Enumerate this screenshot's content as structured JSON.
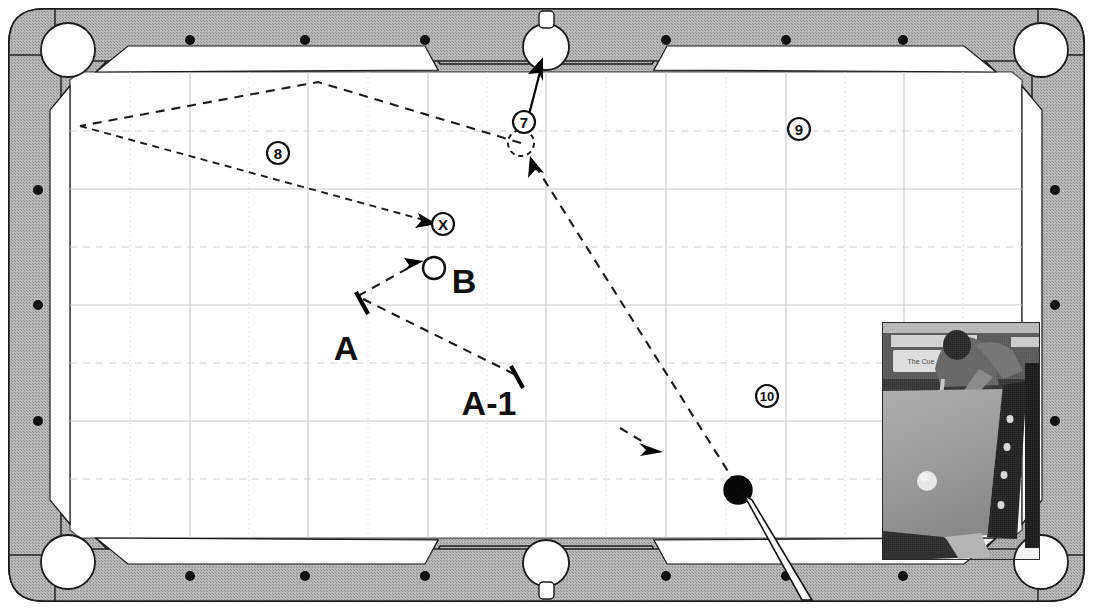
{
  "diagram": {
    "type": "billiards-shot-diagram",
    "canvas": {
      "width": 1093,
      "height": 610
    }
  },
  "colors": {
    "rail": "#b4b4b4",
    "cloth": "#ffffff",
    "ink": "#111111",
    "grid_major": "#c9c9c9",
    "grid_minor": "#d8d8d8"
  },
  "table": {
    "rail_outer": {
      "x": 8,
      "y": 8,
      "width": 1077,
      "height": 594
    },
    "cloth_area": {
      "left": 70,
      "top": 72,
      "right": 1022,
      "bottom": 538
    },
    "pockets": [
      {
        "name": "top-left-pocket",
        "cx": 68,
        "cy": 50,
        "r": 27
      },
      {
        "name": "top-side-pocket",
        "cx": 546,
        "cy": 47,
        "r": 23
      },
      {
        "name": "top-right-pocket",
        "cx": 1041,
        "cy": 50,
        "r": 27
      },
      {
        "name": "bottom-left-pocket",
        "cx": 68,
        "cy": 562,
        "r": 27
      },
      {
        "name": "bottom-side-pocket",
        "cx": 546,
        "cy": 563,
        "r": 23
      },
      {
        "name": "bottom-right-pocket",
        "cx": 1041,
        "cy": 562,
        "r": 27
      }
    ],
    "diamonds": {
      "top": [
        {
          "x": 190,
          "y": 40
        },
        {
          "x": 305,
          "y": 40
        },
        {
          "x": 425,
          "y": 40
        },
        {
          "x": 666,
          "y": 40
        },
        {
          "x": 786,
          "y": 40
        },
        {
          "x": 903,
          "y": 40
        }
      ],
      "bottom": [
        {
          "x": 190,
          "y": 576
        },
        {
          "x": 305,
          "y": 576
        },
        {
          "x": 425,
          "y": 576
        },
        {
          "x": 666,
          "y": 576
        },
        {
          "x": 786,
          "y": 576
        },
        {
          "x": 903,
          "y": 576
        }
      ],
      "left": [
        {
          "x": 38,
          "y": 190
        },
        {
          "x": 38,
          "y": 305
        },
        {
          "x": 38,
          "y": 421
        }
      ],
      "right": [
        {
          "x": 1055,
          "y": 190
        },
        {
          "x": 1055,
          "y": 305
        },
        {
          "x": 1055,
          "y": 421
        }
      ]
    }
  },
  "grid": {
    "major_vertical_x": [
      190,
      308,
      428,
      546,
      666,
      786,
      904
    ],
    "major_horizontal_y": [
      189,
      305,
      421
    ],
    "minor_vertical_x": [
      130,
      249,
      368,
      487,
      606,
      726,
      845,
      963
    ],
    "minor_horizontal_y": [
      131,
      247,
      363,
      479
    ]
  },
  "balls": [
    {
      "name": "ball-8",
      "label": "8",
      "cx": 278,
      "cy": 153,
      "r": 11,
      "style": "numbered-marker"
    },
    {
      "name": "ball-9",
      "label": "9",
      "cx": 799,
      "cy": 129,
      "r": 11,
      "style": "numbered-marker"
    },
    {
      "name": "ball-10",
      "label": "10",
      "cx": 767,
      "cy": 396,
      "r": 11,
      "style": "numbered-marker"
    },
    {
      "name": "ball-7-ghost",
      "label": "7",
      "cx": 521,
      "cy": 143,
      "r": 13,
      "style": "ghost-ball",
      "tag_cx": 524,
      "tag_cy": 122,
      "tag_r": 11
    },
    {
      "name": "target-point-x",
      "label": "X",
      "cx": 443,
      "cy": 224,
      "r": 11,
      "style": "numbered-marker"
    },
    {
      "name": "object-ball-b",
      "label": "B",
      "cx": 434,
      "cy": 268,
      "r": 11,
      "style": "open-ball",
      "text_x": 464,
      "text_y": 281
    },
    {
      "name": "cue-ball",
      "label": "",
      "cx": 738,
      "cy": 490,
      "r": 14,
      "style": "solid-dark"
    }
  ],
  "labels": [
    {
      "name": "label-a",
      "text": "A",
      "x": 346,
      "y": 348,
      "size": 34
    },
    {
      "name": "label-a-1",
      "text": "A-1",
      "x": 489,
      "y": 403,
      "size": 34
    },
    {
      "name": "label-b",
      "text": "B",
      "x": 464,
      "y": 281,
      "size": 34
    }
  ],
  "shot_lines": [
    {
      "name": "bank-path-upper",
      "style": "dashed",
      "points": [
        [
          521,
          143
        ],
        [
          318,
          82
        ],
        [
          80,
          126
        ]
      ],
      "description": "cue path rebounding off left cushion toward the 7"
    },
    {
      "name": "bank-path-lower",
      "style": "dashed",
      "points": [
        [
          80,
          126
        ],
        [
          430,
          221
        ]
      ],
      "arrow_at_end": true,
      "description": "return path from left cushion to the X target point"
    },
    {
      "name": "aim-line-a-to-a1",
      "style": "dashed",
      "points": [
        [
          361,
          296
        ],
        [
          516,
          372
        ]
      ],
      "description": "reference line A to A-1"
    },
    {
      "name": "aim-line-to-b",
      "style": "dashed",
      "points": [
        [
          361,
          296
        ],
        [
          418,
          264
        ]
      ],
      "arrow_at_end": true,
      "description": "aim line pointing at ball B"
    },
    {
      "name": "cue-travel-line",
      "style": "dashed",
      "points": [
        [
          738,
          490
        ],
        [
          533,
          160
        ]
      ],
      "arrow_at_end": true,
      "description": "cue ball travel line from cue ball up to the ghost 7 position"
    },
    {
      "name": "pot-line-7-to-pocket",
      "style": "solid",
      "points": [
        [
          524,
          133
        ],
        [
          540,
          65
        ]
      ],
      "arrow_at_end": true,
      "description": "the 7 ball into the top side pocket"
    },
    {
      "name": "direction-arrow-midtable",
      "style": "solid-short",
      "points": [
        [
          621,
          430
        ],
        [
          660,
          452
        ]
      ],
      "arrow_at_end": true,
      "description": "short direction indicator arrow"
    }
  ],
  "tick_marks": [
    {
      "name": "tick-a",
      "x1": 355,
      "y1": 293,
      "x2": 368,
      "y2": 314
    },
    {
      "name": "tick-a-1",
      "x1": 510,
      "y1": 368,
      "x2": 523,
      "y2": 389
    }
  ],
  "cue_stick": {
    "name": "cue-stick",
    "tip": [
      748,
      497
    ],
    "butt": [
      804,
      597
    ],
    "width": 7
  },
  "photo_inset": {
    "name": "photo-inset",
    "x": 882,
    "y": 322,
    "width": 158,
    "height": 238,
    "caption_on_box": "The Cue",
    "description": "black and white photo of a player leaning over a pool table with a cue ball on the cloth"
  }
}
